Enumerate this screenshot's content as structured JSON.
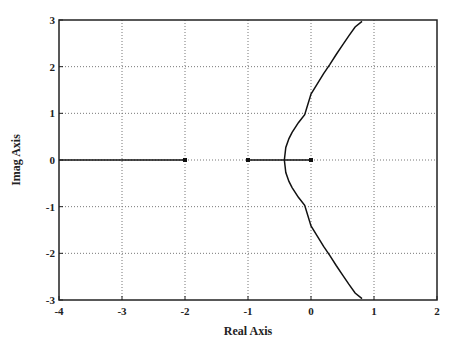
{
  "chart_data": {
    "type": "line",
    "title": "",
    "xlabel": "Real Axis",
    "ylabel": "Imag Axis",
    "xlim": [
      -4,
      2
    ],
    "ylim": [
      -3,
      3
    ],
    "xticks": [
      -4,
      -3,
      -2,
      -1,
      0,
      1,
      2
    ],
    "yticks": [
      -3,
      -2,
      -1,
      0,
      1,
      2,
      3
    ],
    "grid": true,
    "poles": [
      [
        -2,
        0
      ],
      [
        -1,
        0
      ],
      [
        0,
        0
      ]
    ],
    "series": [
      {
        "name": "real-axis-branch-left",
        "x": [
          -4,
          -2
        ],
        "y": [
          0,
          0
        ]
      },
      {
        "name": "real-axis-branch-right",
        "x": [
          -1,
          0
        ],
        "y": [
          0,
          0
        ]
      },
      {
        "name": "upper-branch",
        "x": [
          -0.423,
          -0.4,
          -0.35,
          -0.3,
          -0.2,
          -0.1,
          0,
          0.1,
          0.2,
          0.3,
          0.4,
          0.5,
          0.6,
          0.7,
          0.81
        ],
        "y": [
          0,
          0.27,
          0.46,
          0.59,
          0.8,
          0.97,
          1.414,
          1.63,
          1.85,
          2.05,
          2.26,
          2.46,
          2.66,
          2.85,
          2.97
        ]
      },
      {
        "name": "lower-branch",
        "x": [
          -0.423,
          -0.4,
          -0.35,
          -0.3,
          -0.2,
          -0.1,
          0,
          0.1,
          0.2,
          0.3,
          0.4,
          0.5,
          0.6,
          0.7,
          0.81
        ],
        "y": [
          0,
          -0.27,
          -0.46,
          -0.59,
          -0.8,
          -0.97,
          -1.414,
          -1.63,
          -1.85,
          -2.05,
          -2.26,
          -2.46,
          -2.66,
          -2.85,
          -2.97
        ]
      }
    ],
    "breakaway_point": -0.423,
    "imag_axis_crossing": 1.414
  },
  "labels": {
    "x_axis": "Real Axis",
    "y_axis": "Imag Axis"
  }
}
